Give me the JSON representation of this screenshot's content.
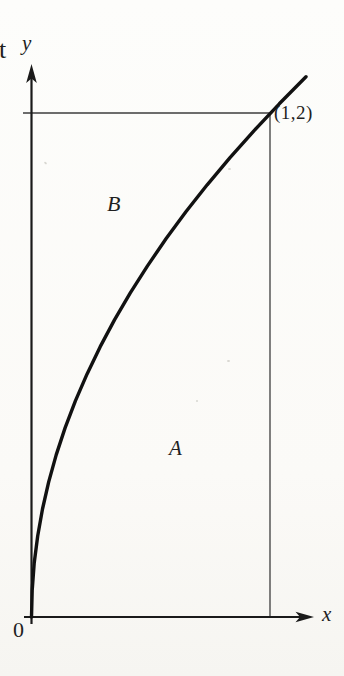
{
  "figure": {
    "labels": {
      "cropped_left_text": "t",
      "y_axis": "y",
      "x_axis": "x",
      "origin": "0",
      "corner_point": "(1,2)",
      "region_above_curve": "B",
      "region_below_curve": "A"
    },
    "colors": {
      "ink": "#1a1a1a",
      "thin_line": "#3d3d3d",
      "paper": "#fbfaf7"
    },
    "bounds": {
      "x_max": 1,
      "y_max": 2
    },
    "curve": {
      "description": "thick curve y = 2*sqrt(x) from origin (0,0) through corner (1,2), continuing slightly beyond",
      "points": [
        [
          0.0,
          0.0
        ],
        [
          0.0029,
          0.1074
        ],
        [
          0.0115,
          0.2148
        ],
        [
          0.026,
          0.3222
        ],
        [
          0.0461,
          0.4296
        ],
        [
          0.0721,
          0.537
        ],
        [
          0.1038,
          0.6444
        ],
        [
          0.1413,
          0.7518
        ],
        [
          0.1846,
          0.8592
        ],
        [
          0.2336,
          0.9666
        ],
        [
          0.2884,
          1.074
        ],
        [
          0.3489,
          1.1814
        ],
        [
          0.4152,
          1.2888
        ],
        [
          0.4873,
          1.3962
        ],
        [
          0.5652,
          1.5036
        ],
        [
          0.6488,
          1.611
        ],
        [
          0.7382,
          1.7184
        ],
        [
          0.8334,
          1.8258
        ],
        [
          0.9343,
          1.9332
        ],
        [
          1.041,
          2.0406
        ],
        [
          1.1535,
          2.148
        ]
      ]
    }
  }
}
